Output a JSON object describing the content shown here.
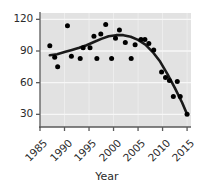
{
  "chart_data": {
    "type": "scatter",
    "title": "",
    "xlabel": "Year",
    "ylabel": "",
    "xlim": [
      1985,
      2015.8
    ],
    "ylim": [
      18,
      126
    ],
    "grid": true,
    "legend": false,
    "xticks": [
      1985,
      1990,
      1995,
      2000,
      2005,
      2010,
      2015
    ],
    "xticklabels": [
      "1985",
      "1990",
      "1995",
      "2000",
      "2005",
      "2010",
      "2015"
    ],
    "yticks": [
      30,
      60,
      90,
      120
    ],
    "yticklabels": [
      "30",
      "60",
      "90",
      "120"
    ],
    "series": [
      {
        "name": "observations",
        "type": "scatter",
        "marker": "circle",
        "color": "#000000",
        "points": [
          [
            1987,
            95
          ],
          [
            1988,
            84
          ],
          [
            1988.6,
            75
          ],
          [
            1990.6,
            114
          ],
          [
            1991.4,
            85
          ],
          [
            1993.2,
            83
          ],
          [
            1993.8,
            93
          ],
          [
            1995.2,
            93
          ],
          [
            1996,
            104
          ],
          [
            1996.6,
            83
          ],
          [
            1997.4,
            106
          ],
          [
            1998.4,
            115
          ],
          [
            1999.6,
            83
          ],
          [
            2000.4,
            102
          ],
          [
            2001.2,
            110
          ],
          [
            2002.4,
            98
          ],
          [
            2003.6,
            83
          ],
          [
            2004.4,
            96
          ],
          [
            2005.6,
            101
          ],
          [
            2006.4,
            101
          ],
          [
            2007.2,
            97
          ],
          [
            2008.2,
            91
          ],
          [
            2009.8,
            70
          ],
          [
            2010.6,
            65
          ],
          [
            2011.4,
            62
          ],
          [
            2012.2,
            47
          ],
          [
            2013,
            61
          ],
          [
            2013.6,
            47
          ],
          [
            2015,
            30
          ]
        ]
      },
      {
        "name": "smoothed-trend",
        "type": "line",
        "color": "#1a1a1a",
        "linewidth": 2.6,
        "points": [
          [
            1987,
            86
          ],
          [
            1988.5,
            87
          ],
          [
            1990,
            89
          ],
          [
            1991.5,
            91
          ],
          [
            1993,
            93
          ],
          [
            1994.5,
            95.5
          ],
          [
            1996,
            98.5
          ],
          [
            1997.5,
            101.5
          ],
          [
            1999,
            104
          ],
          [
            2000.5,
            105
          ],
          [
            2002,
            105
          ],
          [
            2003.5,
            103.5
          ],
          [
            2005,
            100.5
          ],
          [
            2006.5,
            96
          ],
          [
            2008,
            89
          ],
          [
            2009.5,
            80
          ],
          [
            2011,
            68
          ],
          [
            2012.5,
            55
          ],
          [
            2014,
            41
          ],
          [
            2015,
            30
          ]
        ]
      }
    ]
  },
  "axes": {
    "x_title": "Year"
  },
  "style": {
    "panel_bg": "#e2e2e2",
    "grid_color": "#f7f7f7",
    "axis_color": "#5a5a5a",
    "point_color": "#000000",
    "line_color": "#141414",
    "text_color": "#2b2b2b"
  }
}
